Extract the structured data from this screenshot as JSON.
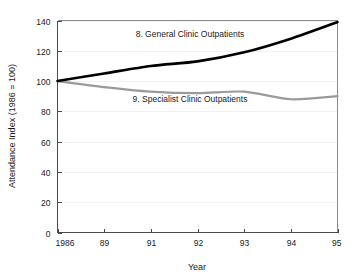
{
  "chart_data": {
    "type": "line",
    "title": "",
    "xlabel": "Year",
    "ylabel": "Attendance Index (1986 = 100)",
    "x": [
      "1986",
      "89",
      "91",
      "92",
      "93",
      "94",
      "95"
    ],
    "categories": [
      "1986",
      "89",
      "91",
      "92",
      "93",
      "94",
      "95"
    ],
    "xticklabels": [
      "1986",
      "89",
      "91",
      "92",
      "93",
      "94",
      "95"
    ],
    "yticklabels": [
      "0",
      "20",
      "40",
      "60",
      "80",
      "100",
      "120",
      "140"
    ],
    "ylim": [
      0,
      140
    ],
    "ytick_step": 20,
    "grid": "horizontal-faint",
    "legend": "inline-annotations",
    "series": [
      {
        "name": "8. General Clinic Outpatients",
        "label": "8. General Clinic Outpatients",
        "color": "#000000",
        "values": [
          100,
          105,
          110,
          113,
          119,
          128,
          139
        ]
      },
      {
        "name": "9. Specialist Clinic Outpatients",
        "label": "9. Specialist Clinic Outpatients",
        "color": "#9a9a9a",
        "values": [
          100,
          96,
          93,
          92,
          93,
          88,
          90
        ]
      }
    ],
    "annotations": [
      {
        "text": "8. General Clinic Outpatients",
        "x_px": 190,
        "y_px": 37
      },
      {
        "text": "9. Specialist Clinic Outpatients",
        "x_px": 190,
        "y_px": 102
      }
    ]
  },
  "axis": {
    "x_title": "Year",
    "y_title": "Attendance Index (1986 = 100)"
  },
  "colors": {
    "series_general": "#000000",
    "series_specialist": "#9a9a9a",
    "axis": "#4a4a4a",
    "grid": "#f2f2f2",
    "background": "#ffffff"
  }
}
